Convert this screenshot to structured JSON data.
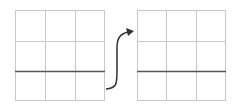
{
  "diagram": {
    "grid_color": "#c8c8c8",
    "line_color": "#555555",
    "arrow_color": "#333333",
    "grids": [
      {
        "id": "left",
        "x": 15,
        "y": 10,
        "width": 90,
        "height": 91,
        "rows": 3,
        "cols": 3,
        "highlight_line_y": 71
      },
      {
        "id": "right",
        "x": 137,
        "y": 10,
        "width": 88,
        "height": 91,
        "rows": 3,
        "cols": 3,
        "highlight_line_y": 71
      }
    ],
    "arrow": {
      "from": "left",
      "to": "right",
      "shape": "s-curve"
    }
  }
}
